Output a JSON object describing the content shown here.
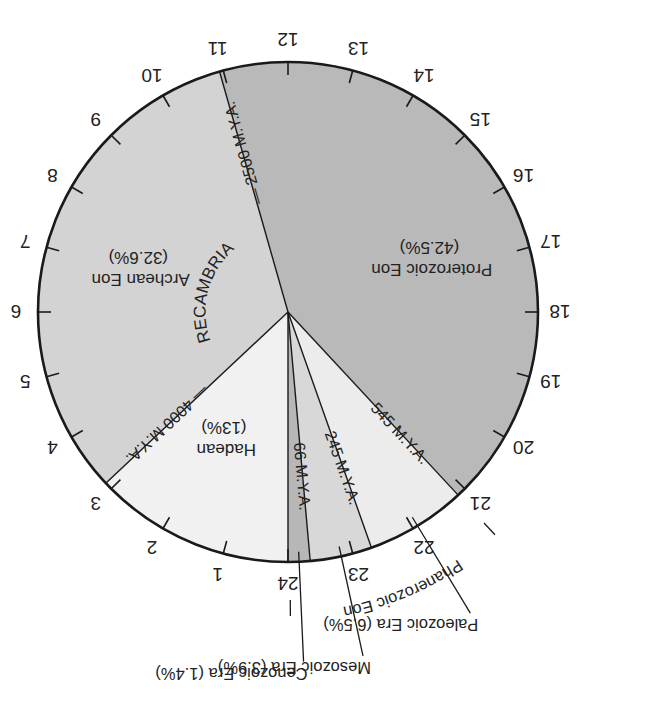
{
  "diagram": {
    "orientation_deg": 180,
    "center": [
      288,
      312
    ],
    "radius": 250,
    "hours": [
      "1",
      "2",
      "3",
      "4",
      "5",
      "6",
      "7",
      "8",
      "9",
      "10",
      "11",
      "12",
      "13",
      "14",
      "15",
      "16",
      "17",
      "18",
      "19",
      "20",
      "21",
      "22",
      "23",
      "24"
    ],
    "colors": {
      "background": "#ffffff",
      "outline": "#1a1a1a",
      "proterozoic": "#b9b9b9",
      "archean": "#d3d3d3",
      "hadean": "#f1f1f1",
      "paleozoic": "#ececec",
      "mesozoic": "#d8d8d8",
      "cenozoic": "#b7b7b7",
      "text": "#222222"
    },
    "segments": [
      {
        "id": "hadean",
        "name": "Hadean",
        "percent_label": "(13%)",
        "start_hour": 0.0,
        "end_hour": 3.12,
        "fill_key": "hadean"
      },
      {
        "id": "archean",
        "name": "Archean Eon",
        "percent_label": "(32.6%)",
        "start_hour": 3.12,
        "end_hour": 10.94,
        "fill_key": "archean"
      },
      {
        "id": "proterozoic",
        "name": "Proterozoic Eon",
        "percent_label": "(42.5%)",
        "start_hour": 10.94,
        "end_hour": 21.14,
        "fill_key": "proterozoic"
      },
      {
        "id": "paleozoic",
        "name": "Paleozoic Era",
        "percent_label": "(6.5%)",
        "start_hour": 21.14,
        "end_hour": 22.7,
        "fill_key": "paleozoic"
      },
      {
        "id": "mesozoic",
        "name": "Mesozoic Era",
        "percent_label": "(3.9%)",
        "start_hour": 22.7,
        "end_hour": 23.66,
        "fill_key": "mesozoic"
      },
      {
        "id": "cenozoic",
        "name": "Cenozoic Era",
        "percent_label": "(1.4%)",
        "start_hour": 23.66,
        "end_hour": 24.0,
        "fill_key": "cenozoic"
      }
    ],
    "boundary_labels": [
      {
        "text": "4000 M.Y.A.",
        "hour": 3.12
      },
      {
        "text": "2500 M.Y.A.",
        "hour": 10.94
      },
      {
        "text": "545 M.Y.A.",
        "hour": 21.14
      },
      {
        "text": "245 M.Y.A.",
        "hour": 22.7
      },
      {
        "text": "66 M.Y.A.",
        "hour": 23.66
      }
    ],
    "inner_labels": {
      "hadean": {
        "line1": "Hadean",
        "line2": "(13%)"
      },
      "archean": {
        "line1": "Archean Eon",
        "line2": "(32.6%)"
      },
      "proterozoic": {
        "line1": "Proterozoic Eon",
        "line2": "(42.5%)"
      }
    },
    "arc_text": {
      "precambrian": "PRECAMBRIAN",
      "phanerozoic": "Phanerozoic Eon"
    },
    "callouts": {
      "paleozoic": "Paleozoic Era (6.5%)",
      "mesozoic": "Mesozoic Era (3.9%)",
      "cenozoic": "Cenozoic Era (1.4%)"
    }
  }
}
